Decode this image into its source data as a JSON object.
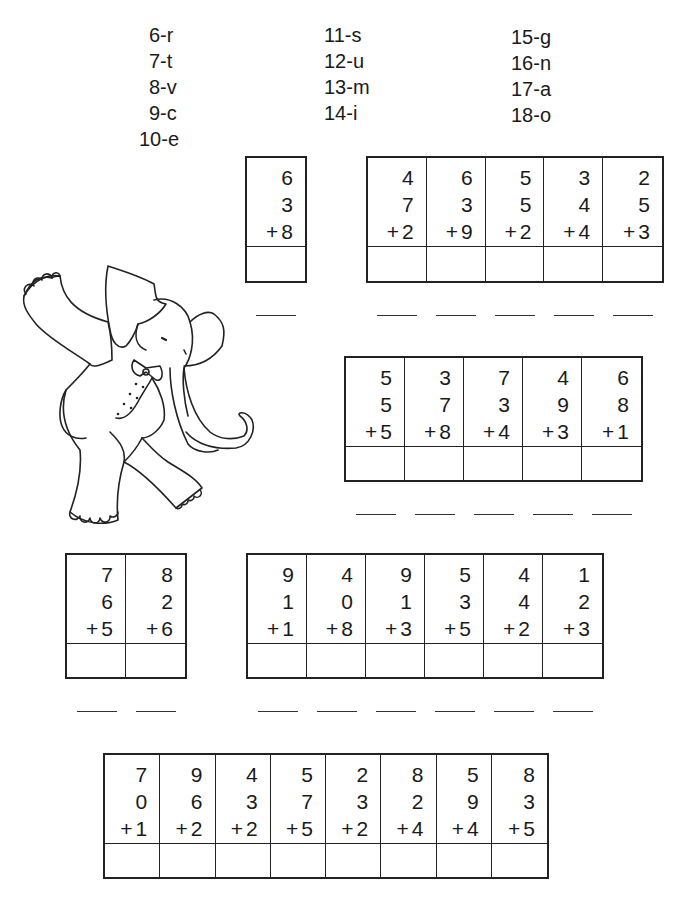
{
  "key": {
    "columns": [
      [
        "6-r",
        "7-t",
        "8-v",
        "9-c",
        "10-e"
      ],
      [
        "11-s",
        "12-u",
        "13-m",
        "14-i"
      ],
      [
        "15-g",
        "16-n",
        "17-a",
        "18-o"
      ]
    ]
  },
  "groups": [
    {
      "problems": [
        {
          "a": "6",
          "b": "3",
          "c": "8"
        }
      ]
    },
    {
      "problems": [
        {
          "a": "4",
          "b": "7",
          "c": "2"
        },
        {
          "a": "6",
          "b": "3",
          "c": "9"
        },
        {
          "a": "5",
          "b": "5",
          "c": "2"
        },
        {
          "a": "3",
          "b": "4",
          "c": "4"
        },
        {
          "a": "2",
          "b": "5",
          "c": "3"
        }
      ]
    },
    {
      "problems": [
        {
          "a": "5",
          "b": "5",
          "c": "5"
        },
        {
          "a": "3",
          "b": "7",
          "c": "8"
        },
        {
          "a": "7",
          "b": "3",
          "c": "4"
        },
        {
          "a": "4",
          "b": "9",
          "c": "3"
        },
        {
          "a": "6",
          "b": "8",
          "c": "1"
        }
      ]
    },
    {
      "problems": [
        {
          "a": "7",
          "b": "6",
          "c": "5"
        },
        {
          "a": "8",
          "b": "2",
          "c": "6"
        }
      ]
    },
    {
      "problems": [
        {
          "a": "9",
          "b": "1",
          "c": "1"
        },
        {
          "a": "4",
          "b": "0",
          "c": "8"
        },
        {
          "a": "9",
          "b": "1",
          "c": "3"
        },
        {
          "a": "5",
          "b": "3",
          "c": "5"
        },
        {
          "a": "4",
          "b": "4",
          "c": "2"
        },
        {
          "a": "1",
          "b": "2",
          "c": "3"
        }
      ]
    },
    {
      "problems": [
        {
          "a": "7",
          "b": "0",
          "c": "1"
        },
        {
          "a": "9",
          "b": "6",
          "c": "2"
        },
        {
          "a": "4",
          "b": "3",
          "c": "2"
        },
        {
          "a": "5",
          "b": "7",
          "c": "5"
        },
        {
          "a": "2",
          "b": "3",
          "c": "2"
        },
        {
          "a": "8",
          "b": "2",
          "c": "4"
        },
        {
          "a": "5",
          "b": "9",
          "c": "4"
        },
        {
          "a": "8",
          "b": "3",
          "c": "5"
        }
      ]
    }
  ],
  "plus_sign": "+",
  "illustration": "dancing-elephant"
}
